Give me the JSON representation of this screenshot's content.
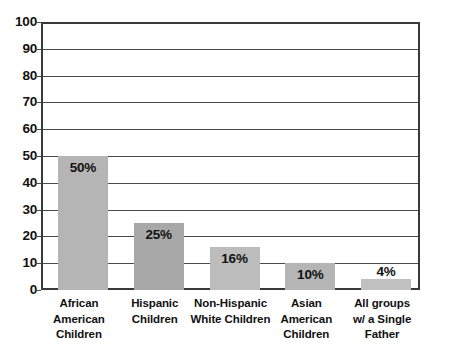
{
  "chart_data": {
    "type": "bar",
    "title": "",
    "xlabel": "",
    "ylabel": "",
    "ylim": [
      0,
      100
    ],
    "grid": true,
    "legend": "none",
    "categories": [
      "African American Children",
      "Hispanic Children",
      "Non-Hispanic White Children",
      "Asian American Children",
      "All groups w/ a Single Father"
    ],
    "category_lines": [
      [
        "African",
        "American",
        "Children"
      ],
      [
        "Hispanic",
        "Children"
      ],
      [
        "Non-Hispanic",
        "White Children"
      ],
      [
        "Asian",
        "American",
        "Children"
      ],
      [
        "All groups",
        "w/ a Single",
        "Father"
      ]
    ],
    "values": [
      50,
      25,
      16,
      10,
      4
    ],
    "value_labels": [
      "50%",
      "25%",
      "16%",
      "10%",
      "4%"
    ],
    "bar_colors": [
      "#b5b5b5",
      "#a8a8a8",
      "#bcbcbc",
      "#b5b5b5",
      "#c0c0c0"
    ],
    "y_ticks": [
      100,
      90,
      80,
      70,
      60,
      50,
      40,
      30,
      20,
      10,
      0
    ],
    "y_tick_labels": [
      "100",
      "90",
      "80",
      "70",
      "60",
      "50",
      "40",
      "30",
      "20",
      "10",
      "0"
    ],
    "axis_color": "#3a3a3a",
    "grid_color": "#4a4a4a",
    "text_color": "#111111",
    "background": "#ffffff"
  }
}
